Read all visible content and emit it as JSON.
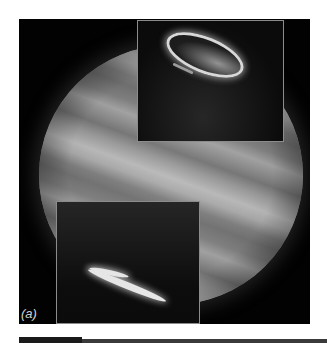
{
  "figure": {
    "label": "(a)",
    "insets": [
      {
        "position": "top-right",
        "content": "north auroral oval"
      },
      {
        "position": "bottom-left",
        "content": "south auroral oval"
      }
    ]
  },
  "colors": {
    "background": "#020202",
    "inset_border": "#8c8c8c",
    "label": "#cfcfcf"
  }
}
